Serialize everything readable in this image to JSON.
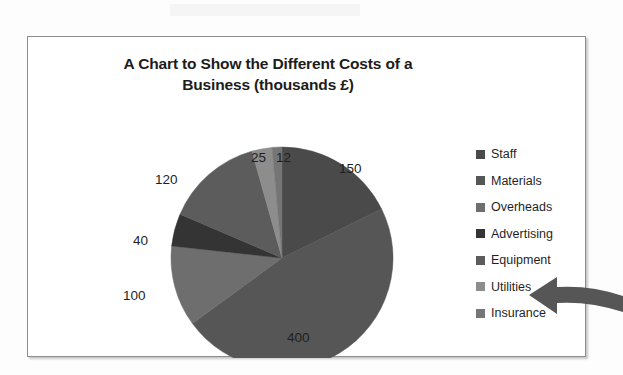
{
  "page": {
    "background_color": "#fdfdfd"
  },
  "chart_frame": {
    "border_color": "#8d8d8d",
    "background_color": "#ffffff"
  },
  "chart_data": {
    "type": "pie",
    "title": "A Chart to Show the Different Costs of a Business (thousands £)",
    "title_line1": "A Chart to Show the Different Costs of a",
    "title_line2": "Business (thousands £)",
    "xlabel": "",
    "ylabel": "",
    "units": "thousands £",
    "total": 847,
    "start_angle_deg": 0,
    "direction": "clockwise",
    "categories": [
      "Staff",
      "Materials",
      "Overheads",
      "Advertising",
      "Equipment",
      "Utilities",
      "Insurance"
    ],
    "values": [
      150,
      400,
      100,
      40,
      120,
      25,
      12
    ],
    "colors": [
      "#4a4a4a",
      "#565656",
      "#6e6e6e",
      "#343434",
      "#5c5c5c",
      "#8d8d8d",
      "#757575"
    ],
    "data_labels": [
      "150",
      "400",
      "100",
      "40",
      "120",
      "25",
      "12"
    ],
    "legend_position": "right",
    "legend": [
      {
        "label": "Staff",
        "color": "#4a4a4a",
        "value": 150
      },
      {
        "label": "Materials",
        "color": "#565656",
        "value": 400
      },
      {
        "label": "Overheads",
        "color": "#6e6e6e",
        "value": 100
      },
      {
        "label": "Advertising",
        "color": "#343434",
        "value": 40
      },
      {
        "label": "Equipment",
        "color": "#5c5c5c",
        "value": 120
      },
      {
        "label": "Utilities",
        "color": "#8d8d8d",
        "value": 25
      },
      {
        "label": "Insurance",
        "color": "#757575",
        "value": 12
      }
    ],
    "grid": false
  },
  "annotation": {
    "arrow_name": "block-arrow-pointing-left",
    "arrow_color": "#565656",
    "points_at": "Utilities"
  }
}
